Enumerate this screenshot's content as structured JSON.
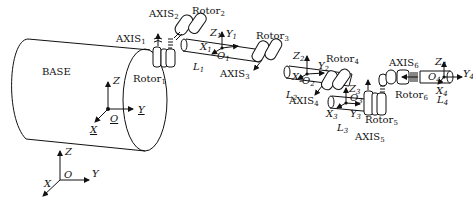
{
  "diagram": {
    "type": "robot-arm-kinematic-schematic",
    "base": {
      "label": "BASE"
    },
    "world_frame": {
      "origin": "O",
      "axes": [
        "X",
        "Y",
        "Z"
      ]
    },
    "base_frame": {
      "origin": "O",
      "axes": [
        "X",
        "Y",
        "Z"
      ],
      "underlined": true
    },
    "axes": [
      {
        "name": "AXIS",
        "index": "1"
      },
      {
        "name": "AXIS",
        "index": "2"
      },
      {
        "name": "AXIS",
        "index": "3"
      },
      {
        "name": "AXIS",
        "index": "4"
      },
      {
        "name": "AXIS",
        "index": "5"
      },
      {
        "name": "AXIS",
        "index": "6"
      }
    ],
    "rotors": [
      {
        "name": "Rotor",
        "index": "1"
      },
      {
        "name": "Rotor",
        "index": "2"
      },
      {
        "name": "Rotor",
        "index": "3"
      },
      {
        "name": "Rotor",
        "index": "4"
      },
      {
        "name": "Rotor",
        "index": "5"
      },
      {
        "name": "Rotor",
        "index": "6"
      }
    ],
    "links": [
      {
        "name": "L",
        "index": "1"
      },
      {
        "name": "L",
        "index": "2"
      },
      {
        "name": "L",
        "index": "3"
      },
      {
        "name": "L",
        "index": "4"
      }
    ],
    "link_frames": [
      {
        "index": "1",
        "O": "O",
        "X": "X",
        "Y": "Y",
        "Z": "Z"
      },
      {
        "index": "2",
        "O": "O",
        "X": "X",
        "Y": "Y",
        "Z": "Z"
      },
      {
        "index": "3",
        "O": "O",
        "X": "X",
        "Y": "Y",
        "Z": "Z"
      },
      {
        "index": "4",
        "O": "O",
        "X": "X",
        "Y": "Y",
        "Z": "Z"
      }
    ]
  }
}
